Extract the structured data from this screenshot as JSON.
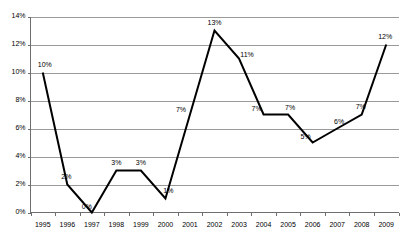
{
  "chart_data": {
    "type": "line",
    "title": "",
    "subtitle": "",
    "xlabel": "",
    "ylabel": "",
    "categories": [
      "1995",
      "1996",
      "1997",
      "1998",
      "1999",
      "2000",
      "2001",
      "2002",
      "2003",
      "2004",
      "2005",
      "2006",
      "2007",
      "2008",
      "2009"
    ],
    "values": [
      10,
      2,
      0,
      3,
      3,
      1,
      7,
      13,
      11,
      7,
      7,
      5,
      6,
      7,
      12
    ],
    "point_labels": [
      "10%",
      "2%",
      "0%",
      "3%",
      "3%",
      "1%",
      "7%",
      "13%",
      "11%",
      "7%",
      "7%",
      "5%",
      "6%",
      "7%",
      "12%"
    ],
    "ylim": [
      0,
      14
    ],
    "ytick_values": [
      0,
      2,
      4,
      6,
      8,
      10,
      12,
      14
    ],
    "ytick_labels": [
      "0%",
      "2%",
      "4%",
      "6%",
      "8%",
      "10%",
      "12%",
      "14%"
    ],
    "grid": true,
    "grid_axis": "y",
    "legend": false,
    "legend_position": "none",
    "series": [
      {
        "name": "",
        "color": "#000000",
        "values": [
          10,
          2,
          0,
          3,
          3,
          1,
          7,
          13,
          11,
          7,
          7,
          5,
          6,
          7,
          12
        ]
      }
    ],
    "label_offsets": [
      {
        "dx": 2,
        "dy": -6
      },
      {
        "dx": -1,
        "dy": -6
      },
      {
        "dx": -5,
        "dy": -4
      },
      {
        "dx": 0,
        "dy": -6
      },
      {
        "dx": 0,
        "dy": -6
      },
      {
        "dx": 3,
        "dy": -6
      },
      {
        "dx": -9,
        "dy": -3
      },
      {
        "dx": 0,
        "dy": -6
      },
      {
        "dx": 8,
        "dy": -2
      },
      {
        "dx": -7,
        "dy": -4
      },
      {
        "dx": 2,
        "dy": -5
      },
      {
        "dx": -7,
        "dy": -4
      },
      {
        "dx": 2,
        "dy": -5
      },
      {
        "dx": -1,
        "dy": -6
      },
      {
        "dx": -1,
        "dy": -6
      }
    ]
  },
  "colors": {
    "background": "#ffffff",
    "series": "#000000",
    "gridline": "#9a9a9a",
    "axis": "#6e6e6e",
    "text": "#000000"
  }
}
